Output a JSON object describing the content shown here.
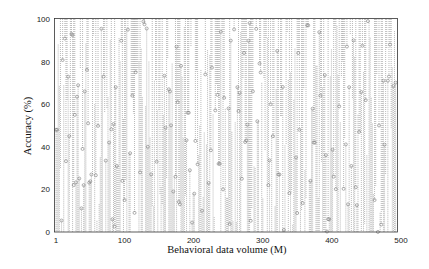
{
  "chart_data": {
    "type": "stem",
    "title": "",
    "xlabel": "Behavioral data volume (M)",
    "ylabel": "Accuracy (%)",
    "xlim": [
      1,
      500
    ],
    "ylim": [
      0,
      100
    ],
    "x_ticks": [
      1,
      100,
      200,
      300,
      400,
      500
    ],
    "x_tick_labels": [
      "1",
      "100",
      "200",
      "300",
      "400",
      "500"
    ],
    "y_ticks": [
      0,
      20,
      40,
      60,
      80,
      100
    ],
    "y_tick_labels": [
      "0",
      "20",
      "40",
      "60",
      "80",
      "100"
    ],
    "grid": false,
    "legend": null,
    "style": {
      "stem_color": "#8a8a8a",
      "marker_color": "#7a7a7a",
      "marker": "hollow-circle",
      "stem_style": "dotted",
      "frame_color": "#333333"
    },
    "x_step": 3,
    "values": [
      48,
      88,
      30,
      70,
      8,
      62,
      45,
      93,
      22,
      55,
      14,
      77,
      39,
      66,
      3,
      51,
      84,
      27,
      60,
      11,
      97,
      35,
      73,
      19,
      58,
      42,
      90,
      6,
      68,
      31,
      80,
      24,
      53,
      15,
      95,
      37,
      64,
      9,
      75,
      46,
      28,
      86,
      17,
      59,
      40,
      99,
      12,
      71,
      33,
      57,
      21,
      82,
      49,
      4,
      67,
      38,
      92,
      26,
      61,
      13,
      78,
      44,
      2,
      56,
      29,
      87,
      18,
      65,
      36,
      96,
      10,
      74,
      41,
      23,
      83,
      50,
      7,
      69,
      32,
      94,
      20,
      63,
      16,
      79,
      47,
      5,
      58,
      34,
      89,
      25,
      72,
      43,
      98,
      14,
      66,
      30,
      81,
      52,
      8,
      70,
      38,
      91,
      22,
      60,
      45,
      12,
      85,
      27,
      54,
      1,
      76,
      40,
      93,
      19,
      62,
      35,
      84,
      48,
      10,
      67,
      29,
      97,
      24,
      57,
      42,
      78,
      16,
      64,
      33,
      88,
      51,
      6,
      73,
      26,
      95,
      39,
      59,
      18,
      80,
      44,
      13,
      68,
      31,
      90,
      21,
      55,
      47,
      3,
      75,
      36,
      99,
      28,
      63,
      15,
      82,
      50,
      9,
      71,
      41,
      86
    ],
    "note": "Dense stem plot; ~500 samples across x=1..500, accuracies spread uniformly 0–100. Values listed are representative samples spaced every 3 M."
  }
}
